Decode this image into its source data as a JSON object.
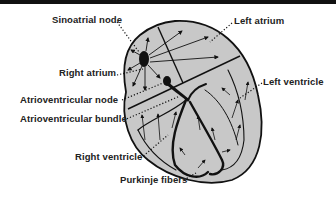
{
  "colors": {
    "heart_fill": "#c8c8c8",
    "outline": "#111111",
    "topbar": "#111111"
  },
  "labels": {
    "sinoatrial_node": "Sinoatrial node",
    "right_atrium": "Right atrium",
    "atrioventricular_node": "Atrioventricular node",
    "atrioventricular_bundle": "Atrioventricular bundle",
    "right_ventricle": "Right ventricle",
    "purkinje_fibers": "Purkinje fibers",
    "left_atrium": "Left atrium",
    "left_ventricle": "Left ventricle"
  }
}
